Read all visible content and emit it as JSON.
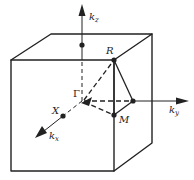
{
  "diagram": {
    "type": "brillouin-zone-cubic",
    "colors": {
      "stroke": "#222222",
      "background": "#ffffff"
    },
    "points": {
      "gamma": {
        "label": "Γ"
      },
      "X": {
        "label": "X"
      },
      "M": {
        "label": "M"
      },
      "R": {
        "label": "R"
      }
    },
    "axes": {
      "kx": {
        "base": "k",
        "sub": "x"
      },
      "ky": {
        "base": "k",
        "sub": "y"
      },
      "kz": {
        "base": "k",
        "sub": "z"
      }
    }
  }
}
